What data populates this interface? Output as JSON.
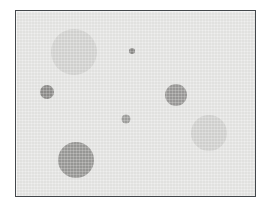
{
  "canvas": {
    "width": 271,
    "height": 213,
    "page_background": "#ffffff",
    "panel": {
      "x": 15,
      "y": 10,
      "width": 241,
      "height": 187,
      "background": "#e6e6e4",
      "border_color": "#44484c",
      "border_width": 1
    }
  },
  "chart_data": {
    "type": "scatter",
    "title": "",
    "subtitle": "",
    "xlabel": "",
    "ylabel": "",
    "xlim": [
      0,
      241
    ],
    "ylim": [
      0,
      187
    ],
    "grid": false,
    "legend": null,
    "axis_visible": false,
    "tick_labels": [],
    "annotations": [],
    "note": "Bubble scatter of 7 gray discs on a light gray panel; coordinates are in panel pixel space with origin at the panel top-left.",
    "series": [
      {
        "name": "bubbles",
        "marker": "circle",
        "points": [
          {
            "id": "bubble-1",
            "label": "large-light-top-left",
            "x": 58,
            "y": 41,
            "r": 23,
            "size": 46,
            "color": "#d4d4d2"
          },
          {
            "id": "bubble-2",
            "label": "small-dark-left",
            "x": 31,
            "y": 81,
            "r": 7,
            "size": 14,
            "color": "#8e8d8b"
          },
          {
            "id": "bubble-3",
            "label": "tiny-dark-top-center",
            "x": 116,
            "y": 40,
            "r": 3,
            "size": 6,
            "color": "#8b8a88"
          },
          {
            "id": "bubble-4",
            "label": "small-mid-center",
            "x": 110,
            "y": 108,
            "r": 4.5,
            "size": 9,
            "color": "#a0a09e"
          },
          {
            "id": "bubble-5",
            "label": "medium-mid-right",
            "x": 160,
            "y": 84,
            "r": 11,
            "size": 22,
            "color": "#9b9a98"
          },
          {
            "id": "bubble-6",
            "label": "large-light-right",
            "x": 193,
            "y": 122,
            "r": 18,
            "size": 36,
            "color": "#d3d3d1"
          },
          {
            "id": "bubble-7",
            "label": "large-dark-bottom-left",
            "x": 60,
            "y": 149,
            "r": 18,
            "size": 36,
            "color": "#9a9997"
          }
        ]
      }
    ]
  }
}
